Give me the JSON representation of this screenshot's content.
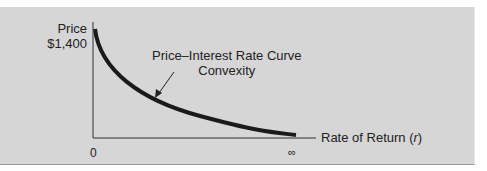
{
  "chart_data": {
    "type": "line",
    "title": "",
    "xlabel": "Rate of Return (r)",
    "xlabel_var": "r",
    "ylabel": "Price",
    "y_tick_labels": [
      "$1,400"
    ],
    "x_tick_labels": [
      "0",
      "∞"
    ],
    "annotation": {
      "line1": "Price–Interest Rate Curve",
      "line2": "Convexity"
    },
    "series": [
      {
        "name": "Price–Interest Rate Curve",
        "description": "Convex decreasing curve from $1,400 at r=0 approaching 0 as r→∞",
        "x": [
          0,
          0.1,
          0.25,
          0.5,
          1.0
        ],
        "y": [
          1400,
          850,
          560,
          320,
          80
        ]
      }
    ],
    "grid": false,
    "legend": "none"
  },
  "colors": {
    "panel_bg": "#d6d6d6",
    "curve": "#1a1a1a",
    "axis": "#333333",
    "text": "#222222"
  }
}
